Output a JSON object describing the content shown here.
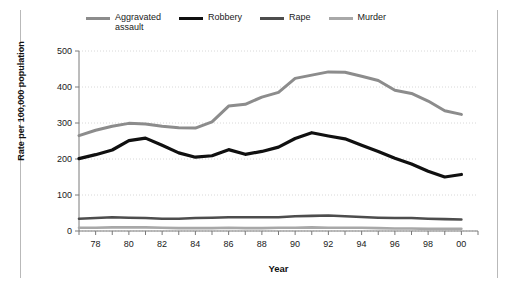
{
  "figure": {
    "background": "#ffffff",
    "frame_color": "#b9b9b9"
  },
  "legend": {
    "position": "top",
    "items": [
      {
        "label": "Aggravated\nassault",
        "color": "#8c8c8c",
        "width": 3
      },
      {
        "label": "Robbery",
        "color": "#101010",
        "width": 3.2
      },
      {
        "label": "Rape",
        "color": "#4d4d4d",
        "width": 3
      },
      {
        "label": "Murder",
        "color": "#a8a8a8",
        "width": 3
      }
    ]
  },
  "axes": {
    "ylabel": "Rate per 100,000 population",
    "xlabel": "Year",
    "yticks": [
      0,
      100,
      200,
      300,
      400,
      500
    ],
    "ytick_labels": [
      "0",
      "100",
      "200",
      "300",
      "400",
      "500"
    ],
    "ylim": [
      0,
      500
    ],
    "xtick_labels": [
      "78",
      "80",
      "82",
      "84",
      "86",
      "88",
      "90",
      "92",
      "94",
      "96",
      "98",
      "00"
    ],
    "xtick_years": [
      1978,
      1980,
      1982,
      1984,
      1986,
      1988,
      1990,
      1992,
      1994,
      1996,
      1998,
      2000
    ],
    "xlim": [
      1977,
      2001
    ],
    "grid": "horizontal-dotted",
    "grid_color": "#d8d8d8"
  },
  "chart_data": {
    "type": "line",
    "title": "",
    "xlabel": "Year",
    "ylabel": "Rate per 100,000 population",
    "ylim": [
      0,
      500
    ],
    "xlim": [
      1977,
      2001
    ],
    "grid": true,
    "legend_position": "top",
    "x": [
      1977,
      1978,
      1979,
      1980,
      1981,
      1982,
      1983,
      1984,
      1985,
      1986,
      1987,
      1988,
      1989,
      1990,
      1991,
      1992,
      1993,
      1994,
      1995,
      1996,
      1997,
      1998,
      1999,
      2000
    ],
    "series": [
      {
        "name": "Aggravated assault",
        "color": "#8c8c8c",
        "values": [
          265,
          280,
          291,
          299,
          297,
          291,
          287,
          286,
          303,
          347,
          352,
          372,
          385,
          424,
          433,
          442,
          441,
          430,
          418,
          391,
          382,
          361,
          334,
          324
        ]
      },
      {
        "name": "Robbery",
        "color": "#101010",
        "values": [
          201,
          212,
          225,
          251,
          258,
          238,
          217,
          205,
          209,
          226,
          213,
          221,
          233,
          257,
          273,
          264,
          256,
          238,
          221,
          202,
          186,
          166,
          150,
          157
        ]
      },
      {
        "name": "Rape",
        "color": "#4d4d4d",
        "values": [
          34,
          36,
          38,
          37,
          36,
          34,
          34,
          36,
          37,
          38,
          38,
          38,
          38,
          41,
          42,
          43,
          41,
          39,
          37,
          36,
          36,
          34,
          33,
          32
        ]
      },
      {
        "name": "Murder",
        "color": "#a8a8a8",
        "values": [
          9,
          9,
          10,
          10,
          10,
          9,
          8,
          8,
          8,
          9,
          8,
          8,
          9,
          9,
          10,
          9,
          9,
          9,
          8,
          7,
          7,
          6,
          6,
          6
        ]
      }
    ]
  }
}
